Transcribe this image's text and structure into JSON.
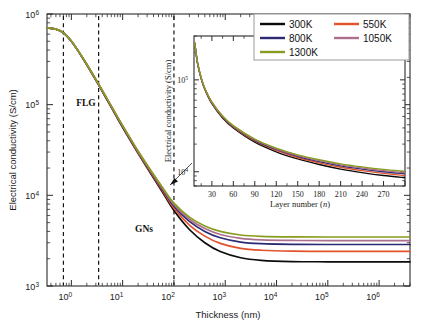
{
  "figure": {
    "title": "",
    "background_color": "#ffffff"
  },
  "main_axes": {
    "xlabel": "Thickness (nm)",
    "ylabel": "Electrical conductivity (S/cm)",
    "x_ticklabels": [
      "10",
      "10",
      "10",
      "10",
      "10",
      "10",
      "10"
    ],
    "x_tick_exponents": [
      "0",
      "1",
      "2",
      "3",
      "4",
      "5",
      "6"
    ],
    "y_ticklabels": [
      "10",
      "10",
      "10",
      "10"
    ],
    "y_tick_exponents": [
      "3",
      "4",
      "5",
      "6"
    ]
  },
  "annotations": {
    "flg": "FLG",
    "gns": "GNs"
  },
  "legend": {
    "entries": [
      {
        "label": "300K",
        "color": "#0b0b0b"
      },
      {
        "label": "550K",
        "color": "#e2532c"
      },
      {
        "label": "800K",
        "color": "#2b2b74"
      },
      {
        "label": "1050K",
        "color": "#ad6f8e"
      },
      {
        "label": "1300K",
        "color": "#8a9c1f"
      }
    ]
  },
  "inset_axes": {
    "xlabel_main": "Layer number (",
    "xlabel_italic": "n",
    "xlabel_close": ")",
    "ylabel": "Electrical conductivity (S/cm)",
    "x_ticklabels": [
      "30",
      "60",
      "90",
      "120",
      "150",
      "180",
      "210",
      "240",
      "270"
    ],
    "y_ticklabels": [
      "10",
      "10"
    ],
    "y_tick_exponents": [
      "4",
      "5"
    ]
  },
  "chart_data": {
    "type": "line",
    "xlabel": "Thickness (nm)",
    "ylabel": "Electrical conductivity (S/cm)",
    "xscale": "log",
    "yscale": "log",
    "xlim": [
      0.335,
      4000000
    ],
    "ylim": [
      1000,
      1000000
    ],
    "grid": false,
    "legend_position": "top-right",
    "annotations": [
      {
        "text": "FLG",
        "x_nm": 1.6,
        "y_S_cm": 100000,
        "note": "few-layer graphene region between dashed lines at 0.7 nm and 3.4 nm"
      },
      {
        "text": "GNs",
        "x_nm": 12,
        "y_S_cm": 2900,
        "note": "graphite nanoplatelets region"
      }
    ],
    "vertical_dashed_lines_nm": [
      0.7,
      3.4,
      100
    ],
    "inset_callout": {
      "from_inset": true,
      "to_x_nm": 80,
      "to_y_S_cm": 5200
    },
    "series": [
      {
        "name": "300K",
        "color": "#0b0b0b",
        "x_nm": [
          0.34,
          0.5,
          0.7,
          1.0,
          1.4,
          2.0,
          3.4,
          5,
          8,
          12,
          20,
          35,
          60,
          100,
          200,
          400,
          800,
          2000,
          5000,
          20000,
          100000,
          1000000,
          4000000
        ],
        "y_S_cm": [
          700000,
          680000,
          620000,
          500000,
          380000,
          275000,
          165000,
          112000,
          70000,
          47000,
          29000,
          17500,
          10800,
          6800,
          4200,
          3000,
          2400,
          2050,
          1920,
          1860,
          1850,
          1850,
          1850
        ]
      },
      {
        "name": "550K",
        "color": "#e2532c",
        "x_nm": [
          0.34,
          0.5,
          0.7,
          1.0,
          1.4,
          2.0,
          3.4,
          5,
          8,
          12,
          20,
          35,
          60,
          100,
          200,
          400,
          800,
          2000,
          5000,
          20000,
          100000,
          1000000,
          4000000
        ],
        "y_S_cm": [
          700000,
          680000,
          620000,
          500000,
          380000,
          276000,
          166000,
          113000,
          71000,
          48000,
          29500,
          18000,
          11200,
          7200,
          4700,
          3550,
          2950,
          2600,
          2480,
          2420,
          2410,
          2410,
          2410
        ]
      },
      {
        "name": "800K",
        "color": "#2b2b74",
        "x_nm": [
          0.34,
          0.5,
          0.7,
          1.0,
          1.4,
          2.0,
          3.4,
          5,
          8,
          12,
          20,
          35,
          60,
          100,
          200,
          400,
          800,
          2000,
          5000,
          20000,
          100000,
          1000000,
          4000000
        ],
        "y_S_cm": [
          700000,
          681000,
          621000,
          501000,
          381000,
          277000,
          167000,
          114000,
          72000,
          48500,
          30000,
          18400,
          11600,
          7600,
          5150,
          4000,
          3400,
          3050,
          2930,
          2880,
          2870,
          2870,
          2870
        ]
      },
      {
        "name": "1050K",
        "color": "#ad6f8e",
        "x_nm": [
          0.34,
          0.5,
          0.7,
          1.0,
          1.4,
          2.0,
          3.4,
          5,
          8,
          12,
          20,
          35,
          60,
          100,
          200,
          400,
          800,
          2000,
          5000,
          20000,
          100000,
          1000000,
          4000000
        ],
        "y_S_cm": [
          700000,
          681000,
          622000,
          502000,
          382000,
          278000,
          168000,
          115000,
          72500,
          49000,
          30400,
          18700,
          11900,
          7900,
          5450,
          4300,
          3700,
          3350,
          3230,
          3180,
          3170,
          3170,
          3170
        ]
      },
      {
        "name": "1300K",
        "color": "#8a9c1f",
        "x_nm": [
          0.34,
          0.5,
          0.7,
          1.0,
          1.4,
          2.0,
          3.4,
          5,
          8,
          12,
          20,
          35,
          60,
          100,
          200,
          400,
          800,
          2000,
          5000,
          20000,
          100000,
          1000000,
          4000000
        ],
        "y_S_cm": [
          700000,
          682000,
          623000,
          503000,
          383000,
          279000,
          169000,
          116000,
          73000,
          49500,
          30800,
          19000,
          12200,
          8200,
          5750,
          4600,
          4000,
          3650,
          3530,
          3480,
          3470,
          3470,
          3470
        ]
      }
    ],
    "inset": {
      "type": "line",
      "xlabel": "Layer number (n)",
      "ylabel": "Electrical conductivity (S/cm)",
      "xscale": "linear",
      "yscale": "log",
      "xlim": [
        5,
        300
      ],
      "ylim": [
        7000,
        300000
      ],
      "grid": false,
      "series": [
        {
          "name": "300K",
          "color": "#0b0b0b",
          "x_layers": [
            6,
            10,
            15,
            20,
            30,
            45,
            60,
            90,
            120,
            150,
            180,
            210,
            240,
            270,
            300
          ],
          "y_S_cm": [
            250000,
            150000,
            103000,
            79000,
            55000,
            38500,
            30000,
            21000,
            16500,
            13800,
            12000,
            10700,
            9800,
            9100,
            8600
          ]
        },
        {
          "name": "550K",
          "color": "#e2532c",
          "x_layers": [
            6,
            10,
            15,
            20,
            30,
            45,
            60,
            90,
            120,
            150,
            180,
            210,
            240,
            270,
            300
          ],
          "y_S_cm": [
            251000,
            151000,
            104000,
            80000,
            56000,
            39200,
            30600,
            21600,
            17100,
            14300,
            12500,
            11200,
            10300,
            9600,
            9100
          ]
        },
        {
          "name": "800K",
          "color": "#2b2b74",
          "x_layers": [
            6,
            10,
            15,
            20,
            30,
            45,
            60,
            90,
            120,
            150,
            180,
            210,
            240,
            270,
            300
          ],
          "y_S_cm": [
            252000,
            152000,
            105000,
            80500,
            56500,
            39700,
            31000,
            22000,
            17500,
            14700,
            12900,
            11600,
            10700,
            10000,
            9500
          ]
        },
        {
          "name": "1050K",
          "color": "#ad6f8e",
          "x_layers": [
            6,
            10,
            15,
            20,
            30,
            45,
            60,
            90,
            120,
            150,
            180,
            210,
            240,
            270,
            300
          ],
          "y_S_cm": [
            253000,
            153000,
            105500,
            81000,
            57000,
            40100,
            31400,
            22300,
            17800,
            15000,
            13200,
            11900,
            11000,
            10300,
            9800
          ]
        },
        {
          "name": "1300K",
          "color": "#8a9c1f",
          "x_layers": [
            6,
            10,
            15,
            20,
            30,
            45,
            60,
            90,
            120,
            150,
            180,
            210,
            240,
            270,
            300
          ],
          "y_S_cm": [
            254000,
            154000,
            106000,
            81500,
            57500,
            40500,
            31800,
            22700,
            18100,
            15300,
            13500,
            12200,
            11300,
            10600,
            10100
          ]
        }
      ]
    }
  }
}
